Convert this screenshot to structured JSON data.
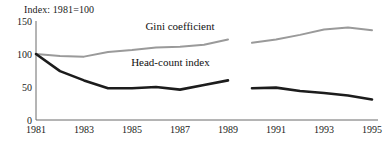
{
  "chart_data": {
    "type": "line",
    "title": "",
    "note": "Index: 1981=100",
    "xlabel": "",
    "ylabel": "",
    "xlim": [
      1981,
      1995
    ],
    "ylim": [
      0,
      150
    ],
    "yticks": [
      0,
      50,
      100,
      150
    ],
    "xticks": [
      1981,
      1983,
      1985,
      1987,
      1989,
      1991,
      1993,
      1995
    ],
    "xtick_labels": [
      "1981",
      "1983",
      "1985",
      "1987",
      "1989",
      "1991",
      "1993",
      "1995"
    ],
    "ytick_labels": [
      "0",
      "50",
      "100",
      "150"
    ],
    "grid": false,
    "legend": "inline-annotations",
    "break_between": [
      1989,
      1990
    ],
    "series": [
      {
        "name": "Gini coefficient",
        "color": "#9a9a9a",
        "label_x": 1987.0,
        "label_y": 136,
        "segments": [
          {
            "x": [
              1981,
              1982,
              1983,
              1984,
              1985,
              1986,
              1987,
              1988,
              1989
            ],
            "values": [
              100,
              97,
              96,
              103,
              106,
              110,
              111,
              114,
              122
            ]
          },
          {
            "x": [
              1990,
              1991,
              1992,
              1993,
              1994,
              1995
            ],
            "values": [
              117,
              122,
              129,
              137,
              140,
              136
            ]
          }
        ]
      },
      {
        "name": "Head-count index",
        "color": "#1c1c1c",
        "label_x": 1986.6,
        "label_y": 82,
        "segments": [
          {
            "x": [
              1981,
              1982,
              1983,
              1984,
              1985,
              1986,
              1987,
              1988,
              1989
            ],
            "values": [
              100,
              74,
              60,
              48,
              48,
              50,
              46,
              53,
              60
            ]
          },
          {
            "x": [
              1990,
              1991,
              1992,
              1993,
              1994,
              1995
            ],
            "values": [
              48,
              49,
              44,
              41,
              37,
              31
            ]
          }
        ]
      }
    ]
  }
}
